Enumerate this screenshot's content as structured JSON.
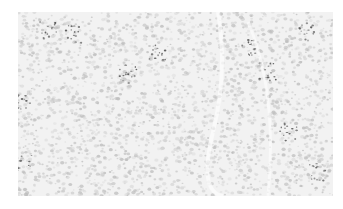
{
  "image": {
    "description": "Grayscale microscopy image of a densely cellular tissue section",
    "colors": {
      "background": "#ffffff",
      "tissue_base": "#f2f2f2",
      "cell_light": "#d6d6d6",
      "cell_mid": "#bdbdbd",
      "nucleus_dark": "#4a4a4a"
    }
  }
}
